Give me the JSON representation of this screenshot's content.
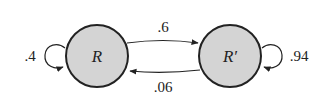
{
  "diagram": {
    "type": "markov-chain",
    "colors": {
      "node_fill": "#d4d4d4",
      "stroke": "#222222",
      "background": "#ffffff"
    },
    "nodes": [
      {
        "id": "R",
        "label": "R"
      },
      {
        "id": "R_prime",
        "label": "R′"
      }
    ],
    "edges": [
      {
        "from": "R",
        "to": "R",
        "label": ".4",
        "kind": "self-loop"
      },
      {
        "from": "R",
        "to": "R_prime",
        "label": ".6"
      },
      {
        "from": "R_prime",
        "to": "R",
        "label": ".06"
      },
      {
        "from": "R_prime",
        "to": "R_prime",
        "label": ".94",
        "kind": "self-loop"
      }
    ]
  }
}
